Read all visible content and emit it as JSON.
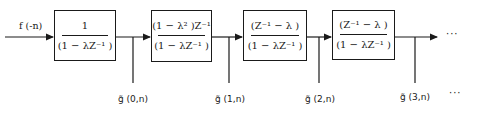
{
  "input_label": "f (-n)",
  "blocks": [
    {
      "numerator": "1",
      "denominator": "(1 − λZ⁻¹ )"
    },
    {
      "numerator": "(1 − λ² )Z⁻¹",
      "denominator": "(1 − λZ⁻¹ )"
    },
    {
      "numerator": "(Z⁻¹  − λ )",
      "denominator": "(1 − λZ⁻¹ )"
    },
    {
      "numerator": "(Z⁻¹  − λ )",
      "denominator": "(1 − λZ⁻¹ )"
    }
  ],
  "outputs": [
    {
      "label": "g̃ (0,n)"
    },
    {
      "label": "g̃ (1,n)"
    },
    {
      "label": "g̃ (2,n)"
    },
    {
      "label": "g̃ (3,n)"
    }
  ],
  "continuation_top": "···",
  "continuation_bottom": "···",
  "line_color": "#1a1a1a"
}
